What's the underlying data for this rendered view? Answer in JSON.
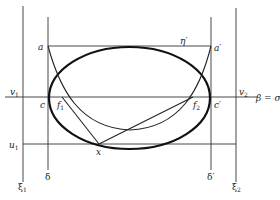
{
  "diagram": {
    "labels": {
      "a": "a",
      "a_prime": "a′",
      "eta_prime": "η′",
      "v1": "v",
      "v1_sub": "1",
      "v2": "v",
      "v2_sub": "2",
      "beta_sigma": "β = σ",
      "c": "c",
      "c_prime": "c′",
      "f1": "f",
      "f1_sub": "1",
      "f2": "f",
      "f2_sub": "2",
      "u1": "u",
      "u1_sub": "1",
      "x": "x",
      "xi1": "ξ",
      "xi1_sub": "1",
      "xi2": "ξ",
      "xi2_sub": "2",
      "delta": "δ",
      "delta_prime": "δ′"
    },
    "colors": {
      "stroke": "#111111",
      "background": "#ffffff"
    }
  }
}
